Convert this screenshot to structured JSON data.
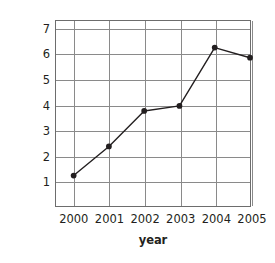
{
  "chart_data": {
    "type": "line",
    "title": "",
    "xlabel": "year",
    "ylabel": "profit in million USD",
    "categories": [
      "2000",
      "2001",
      "2002",
      "2003",
      "2004",
      "2005"
    ],
    "x": [
      2000,
      2001,
      2002,
      2003,
      2004,
      2005
    ],
    "values": [
      1.2,
      2.35,
      3.75,
      3.95,
      6.25,
      5.85
    ],
    "series": [
      {
        "name": "profit",
        "values": [
          1.2,
          2.35,
          3.75,
          3.95,
          6.25,
          5.85
        ]
      }
    ],
    "ylim": [
      0,
      7.3
    ],
    "xlim": [
      1999.5,
      2005.0
    ],
    "yticks": [
      1,
      2,
      3,
      4,
      5,
      6,
      7
    ],
    "ytick_labels": [
      "1",
      "2",
      "3",
      "4",
      "5",
      "6",
      "7"
    ],
    "xtick_labels": [
      "2000",
      "2001",
      "2002",
      "2003",
      "2004",
      "2005"
    ],
    "grid": true,
    "legend": false,
    "legend_position": "none",
    "marker": "filled-circle",
    "line_color": "#231f20",
    "marker_color": "#231f20",
    "grid_color": "#8a8a8a",
    "axis_color": "#6d6d6d",
    "background_color": "#ffffff",
    "text_color": "#231f20"
  }
}
